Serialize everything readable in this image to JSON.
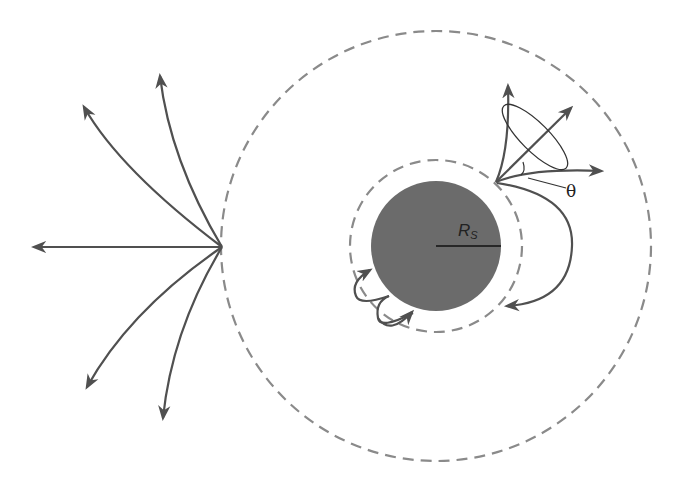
{
  "diagram": {
    "title": "",
    "labels": {
      "schwarzschild_radius_main": "R",
      "schwarzschild_radius_sub": "S",
      "cone_angle": "θ"
    },
    "elements": {
      "black_hole": {
        "cx": 436,
        "cy": 246,
        "r": 65,
        "fill": "#6b6b6b"
      },
      "photon_sphere": {
        "cx": 436,
        "cy": 246,
        "r": 86,
        "style": "dashed",
        "stroke": "#888888"
      },
      "outer_circle": {
        "cx": 436,
        "cy": 246,
        "r": 215,
        "style": "dashed",
        "stroke": "#888888"
      },
      "left_emitter": {
        "x": 222,
        "y": 247,
        "rays": 5
      },
      "right_emitter": {
        "x": 496,
        "y": 182,
        "rays": 4,
        "cone": true
      }
    },
    "colors": {
      "ray": "#505050",
      "dash": "#8a8a8a",
      "disk": "#6b6b6b"
    }
  }
}
